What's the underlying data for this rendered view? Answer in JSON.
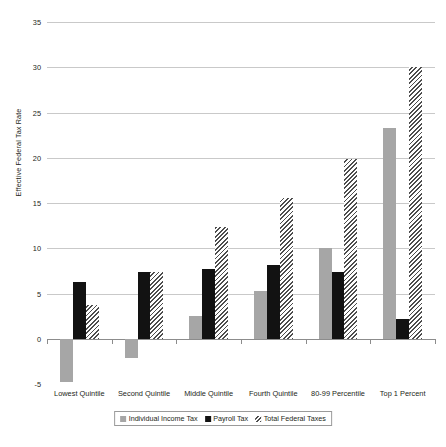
{
  "chart_data": {
    "type": "bar",
    "title": "",
    "subtitle": "",
    "xlabel": "",
    "ylabel": "Effective Federal Tax Rate",
    "ylim": [
      -5,
      35
    ],
    "yticks": [
      -5,
      0,
      5,
      10,
      15,
      20,
      25,
      30,
      35
    ],
    "ytick_labels": [
      "-5",
      "0",
      "5",
      "10",
      "15",
      "20",
      "25",
      "30",
      "35"
    ],
    "grid": true,
    "legend_position": "bottom",
    "categories": [
      "Lowest Quintile",
      "Second Quintile",
      "Middle Quintile",
      "Fourth Quintile",
      "80-99 Percentile",
      "Top 1 Percent"
    ],
    "series": [
      {
        "name": "Individual Income Tax",
        "color": "#a6a6a6",
        "pattern": "solid",
        "values": [
          -4.8,
          -2.1,
          2.5,
          5.3,
          10.0,
          23.3
        ]
      },
      {
        "name": "Payroll Tax",
        "color": "#121212",
        "pattern": "solid",
        "values": [
          6.3,
          7.4,
          7.7,
          8.1,
          7.4,
          2.2
        ]
      },
      {
        "name": "Total Federal Taxes",
        "color": "#4d4d4d",
        "pattern": "diagonal-hatch",
        "values": [
          3.7,
          7.4,
          12.3,
          15.6,
          19.9,
          30.0
        ]
      }
    ]
  },
  "legend": {
    "items": [
      {
        "label": "Individual Income Tax",
        "swatch": "income"
      },
      {
        "label": "Payroll Tax",
        "swatch": "payroll"
      },
      {
        "label": "Total Federal Taxes",
        "swatch": "total"
      }
    ]
  }
}
